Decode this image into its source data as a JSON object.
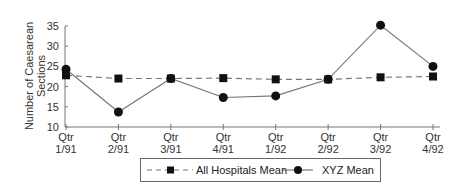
{
  "chart_data": {
    "type": "line",
    "title": "",
    "xlabel": "",
    "ylabel": "Number of Caesarean Sections",
    "ylabel_lines": [
      "Number of Caesarean",
      "Sections"
    ],
    "ylim": [
      10,
      35
    ],
    "yticks": [
      10,
      15,
      20,
      25,
      30,
      35
    ],
    "categories": [
      "Qtr 1/91",
      "Qtr 2/91",
      "Qtr 3/91",
      "Qtr 4/91",
      "Qtr 1/92",
      "Qtr 2/92",
      "Qtr 3/92",
      "Qtr 4/92"
    ],
    "category_lines": [
      [
        "Qtr",
        "1/91"
      ],
      [
        "Qtr",
        "2/91"
      ],
      [
        "Qtr",
        "3/91"
      ],
      [
        "Qtr",
        "4/91"
      ],
      [
        "Qtr",
        "1/92"
      ],
      [
        "Qtr",
        "2/92"
      ],
      [
        "Qtr",
        "3/92"
      ],
      [
        "Qtr",
        "4/92"
      ]
    ],
    "grid": false,
    "legend_position": "bottom",
    "series": [
      {
        "name": "All Hospitals Mean",
        "marker": "square",
        "line": "dashed",
        "color": "#111111",
        "line_color": "#777777",
        "values": [
          22.8,
          22.0,
          22.0,
          22.1,
          21.8,
          21.8,
          22.3,
          22.5
        ]
      },
      {
        "name": "XYZ Mean",
        "marker": "circle",
        "line": "solid",
        "color": "#111111",
        "line_color": "#777777",
        "values": [
          24.3,
          13.7,
          22.0,
          17.3,
          17.7,
          21.8,
          35.2,
          25.0
        ]
      }
    ]
  }
}
